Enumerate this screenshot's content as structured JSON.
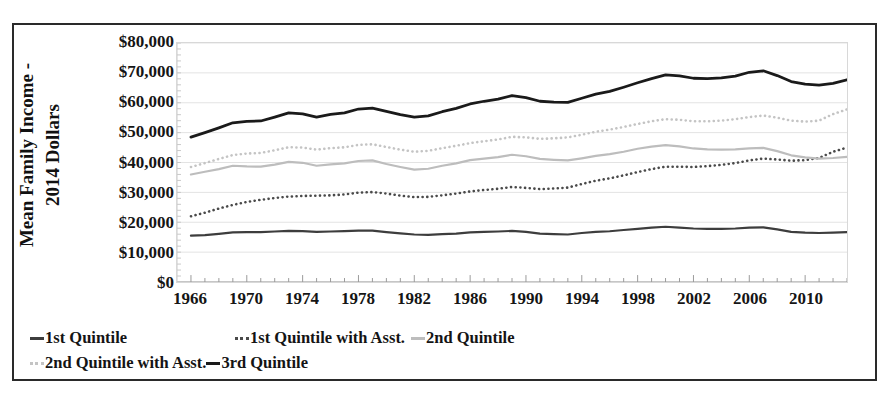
{
  "axes": {
    "y_title_line1": "Mean Family Income -",
    "y_title_line2": "2014 Dollars",
    "y_ticks": [
      "$80,000",
      "$70,000",
      "$60,000",
      "$50,000",
      "$40,000",
      "$30,000",
      "$20,000",
      "$10,000",
      "$0"
    ],
    "x_ticks": [
      "1966",
      "1970",
      "1974",
      "1978",
      "1982",
      "1986",
      "1990",
      "1994",
      "1998",
      "2002",
      "2006",
      "2010"
    ]
  },
  "legend": {
    "items": [
      {
        "label": "1st Quintile",
        "style": "solid",
        "color": "#3d3d3d"
      },
      {
        "label": "1st Quintile with Asst.",
        "style": "dotted",
        "color": "#4a4a4a"
      },
      {
        "label": "2nd Quintile",
        "style": "solid",
        "color": "#bdbdbd"
      },
      {
        "label": "2nd Quintile with Asst.",
        "style": "dotted",
        "color": "#c4c4c4"
      },
      {
        "label": "3rd Quintile",
        "style": "solid",
        "color": "#1a1a1a"
      }
    ]
  },
  "chart_data": {
    "type": "line",
    "title": "",
    "xlabel": "",
    "ylabel": "Mean Family Income - 2014 Dollars",
    "xlim": [
      1965,
      2013
    ],
    "ylim": [
      0,
      80000
    ],
    "ytick_values": [
      0,
      10000,
      20000,
      30000,
      40000,
      50000,
      60000,
      70000,
      80000
    ],
    "grid": true,
    "legend_position": "bottom",
    "x": [
      1966,
      1967,
      1968,
      1969,
      1970,
      1971,
      1972,
      1973,
      1974,
      1975,
      1976,
      1977,
      1978,
      1979,
      1980,
      1981,
      1982,
      1983,
      1984,
      1985,
      1986,
      1987,
      1988,
      1989,
      1990,
      1991,
      1992,
      1993,
      1994,
      1995,
      1996,
      1997,
      1998,
      1999,
      2000,
      2001,
      2002,
      2003,
      2004,
      2005,
      2006,
      2007,
      2008,
      2009,
      2010,
      2011,
      2012,
      2013
    ],
    "series": [
      {
        "name": "1st Quintile",
        "style": "solid",
        "color": "#3d3d3d",
        "values": [
          15500,
          15700,
          16100,
          16600,
          16700,
          16700,
          16900,
          17100,
          17000,
          16800,
          16900,
          17000,
          17200,
          17200,
          16700,
          16300,
          15900,
          15800,
          16000,
          16200,
          16600,
          16800,
          16900,
          17100,
          16800,
          16200,
          16000,
          15900,
          16400,
          16800,
          17000,
          17400,
          17800,
          18200,
          18500,
          18200,
          17900,
          17800,
          17800,
          17900,
          18200,
          18300,
          17600,
          16800,
          16500,
          16400,
          16500,
          16700
        ]
      },
      {
        "name": "1st Quintile with Asst.",
        "style": "dotted",
        "color": "#4a4a4a",
        "values": [
          22000,
          23200,
          24600,
          25800,
          26800,
          27500,
          28100,
          28600,
          28800,
          28900,
          29000,
          29300,
          29900,
          30100,
          29600,
          28900,
          28400,
          28500,
          29000,
          29600,
          30300,
          30800,
          31200,
          31800,
          31500,
          31100,
          31300,
          31600,
          32800,
          33900,
          34700,
          35700,
          36800,
          37800,
          38600,
          38600,
          38500,
          38800,
          39200,
          39800,
          40700,
          41300,
          41000,
          40600,
          40800,
          41500,
          43600,
          45000
        ]
      },
      {
        "name": "2nd Quintile",
        "style": "solid",
        "color": "#bdbdbd",
        "values": [
          36000,
          36900,
          37800,
          38900,
          38700,
          38600,
          39300,
          40200,
          39900,
          38900,
          39400,
          39700,
          40500,
          40700,
          39500,
          38500,
          37600,
          37900,
          38900,
          39700,
          40800,
          41300,
          41800,
          42600,
          42100,
          41200,
          40900,
          40700,
          41400,
          42200,
          42800,
          43600,
          44600,
          45300,
          45800,
          45400,
          44700,
          44400,
          44300,
          44400,
          44700,
          44900,
          43800,
          42400,
          41700,
          41300,
          41500,
          41900
        ]
      },
      {
        "name": "2nd Quintile with Asst.",
        "style": "dotted",
        "color": "#c4c4c4",
        "values": [
          38500,
          39800,
          41200,
          42500,
          43000,
          43200,
          44100,
          45100,
          45000,
          44300,
          44800,
          45100,
          45900,
          46100,
          45200,
          44300,
          43600,
          43900,
          44800,
          45600,
          46500,
          47100,
          47700,
          48600,
          48400,
          47900,
          48100,
          48400,
          49300,
          50300,
          51000,
          51900,
          52900,
          53800,
          54500,
          54300,
          53800,
          53800,
          54000,
          54500,
          55200,
          55700,
          55000,
          54000,
          53700,
          54000,
          56200,
          57800
        ]
      },
      {
        "name": "3rd Quintile",
        "style": "solid",
        "color": "#1a1a1a",
        "values": [
          48500,
          50000,
          51600,
          53300,
          53800,
          53900,
          55200,
          56600,
          56300,
          55200,
          56100,
          56600,
          57900,
          58200,
          57100,
          56000,
          55200,
          55600,
          57000,
          58100,
          59600,
          60500,
          61200,
          62400,
          61700,
          60500,
          60200,
          60100,
          61500,
          62900,
          63800,
          65200,
          66700,
          68100,
          69300,
          69000,
          68200,
          68100,
          68300,
          68900,
          70200,
          70700,
          69100,
          67100,
          66200,
          65900,
          66500,
          67700
        ]
      }
    ]
  }
}
